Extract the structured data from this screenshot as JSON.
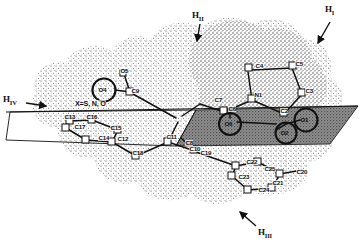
{
  "figure": {
    "type": "molecular-structure-diagram",
    "substituent_note": "X=S, N, O"
  },
  "colors": {
    "ink": "#111111",
    "stipple": "#4a4a4a",
    "plane_fill": "#8c8c8c",
    "background": "#ffffff"
  },
  "hydrogen_labels": [
    {
      "id": "H_I",
      "base": "H",
      "sub": "I",
      "x": 325,
      "y": 5,
      "arrow_from": [
        330,
        22
      ],
      "arrow_to": [
        317,
        44
      ]
    },
    {
      "id": "H_II",
      "base": "H",
      "sub": "II",
      "x": 192,
      "y": 11,
      "arrow_from": [
        200,
        24
      ],
      "arrow_to": [
        196,
        41
      ]
    },
    {
      "id": "H_III",
      "base": "H",
      "sub": "III",
      "x": 258,
      "y": 228,
      "arrow_from": [
        256,
        228
      ],
      "arrow_to": [
        239,
        213
      ]
    },
    {
      "id": "H_IV",
      "base": "H",
      "sub": "IV",
      "x": 3,
      "y": 95,
      "arrow_from": [
        28,
        103
      ],
      "arrow_to": [
        47,
        106
      ]
    }
  ],
  "circled_atoms": [
    {
      "label": "O4",
      "cx": 104,
      "cy": 90,
      "r": 11.5
    },
    {
      "label": "O6",
      "cx": 230,
      "cy": 124,
      "r": 11.0
    },
    {
      "label": "O1",
      "cx": 306,
      "cy": 120,
      "r": 11.5
    },
    {
      "label": "O2",
      "cx": 286,
      "cy": 133,
      "r": 10.5
    }
  ],
  "atom_labels": [
    {
      "label": "O5",
      "x": 120,
      "y": 68
    },
    {
      "label": "C9",
      "x": 131,
      "y": 88
    },
    {
      "label": "C4",
      "x": 255,
      "y": 63
    },
    {
      "label": "C5",
      "x": 295,
      "y": 61
    },
    {
      "label": "C3",
      "x": 305,
      "y": 88
    },
    {
      "label": "N1",
      "x": 254,
      "y": 92
    },
    {
      "label": "C6",
      "x": 228,
      "y": 106
    },
    {
      "label": "C2",
      "x": 280,
      "y": 108
    },
    {
      "label": "C7",
      "x": 214,
      "y": 97
    },
    {
      "label": "C13",
      "x": 64,
      "y": 114
    },
    {
      "label": "C16",
      "x": 86,
      "y": 114
    },
    {
      "label": "C17",
      "x": 74,
      "y": 124
    },
    {
      "label": "C15",
      "x": 110,
      "y": 125
    },
    {
      "label": "C14",
      "x": 98,
      "y": 135
    },
    {
      "label": "C12",
      "x": 117,
      "y": 136
    },
    {
      "label": "C18",
      "x": 132,
      "y": 150
    },
    {
      "label": "C11",
      "x": 166,
      "y": 134
    },
    {
      "label": "C10",
      "x": 189,
      "y": 146
    },
    {
      "label": "C8",
      "x": 185,
      "y": 140
    },
    {
      "label": "C19",
      "x": 200,
      "y": 150
    },
    {
      "label": "C22",
      "x": 246,
      "y": 159
    },
    {
      "label": "C25",
      "x": 264,
      "y": 166
    },
    {
      "label": "C23",
      "x": 238,
      "y": 174
    },
    {
      "label": "C21",
      "x": 272,
      "y": 180
    },
    {
      "label": "C24",
      "x": 258,
      "y": 187
    },
    {
      "label": "C20",
      "x": 296,
      "y": 169
    }
  ],
  "substituent_label": {
    "text": "X=S, N, O",
    "x": 75,
    "y": 100
  }
}
